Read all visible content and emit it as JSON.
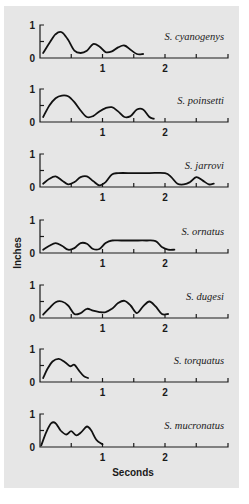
{
  "chart_data": {
    "type": "line",
    "title": "",
    "xlabel": "Seconds",
    "ylabel": "Inches",
    "xlim": [
      0,
      3
    ],
    "ylim": [
      0,
      1
    ],
    "x_ticks": [
      0.5,
      1,
      1.5,
      2,
      2.5,
      3
    ],
    "x_tick_labels": [
      {
        "value": 1,
        "label": "1"
      },
      {
        "value": 2,
        "label": "2"
      }
    ],
    "y_tick_labels": [
      {
        "value": 0,
        "label": "0"
      },
      {
        "value": 1,
        "label": "1"
      }
    ],
    "y_minor_ticks": [
      0.5
    ],
    "grid": false,
    "layout": "7 stacked small-multiple panels sharing x axis",
    "series": [
      {
        "name": "S. cyanogenys",
        "x": [
          0.05,
          0.15,
          0.25,
          0.35,
          0.45,
          0.55,
          0.65,
          0.75,
          0.85,
          0.95,
          1.05,
          1.15,
          1.25,
          1.35,
          1.45,
          1.55,
          1.65
        ],
        "values": [
          0.15,
          0.45,
          0.72,
          0.78,
          0.55,
          0.22,
          0.15,
          0.22,
          0.42,
          0.35,
          0.18,
          0.2,
          0.32,
          0.38,
          0.25,
          0.12,
          0.12
        ]
      },
      {
        "name": "S. poinsetti",
        "x": [
          0.05,
          0.15,
          0.25,
          0.35,
          0.45,
          0.55,
          0.65,
          0.75,
          0.85,
          0.95,
          1.05,
          1.15,
          1.25,
          1.35,
          1.45,
          1.55,
          1.65,
          1.75,
          1.82
        ],
        "values": [
          0.15,
          0.5,
          0.72,
          0.8,
          0.78,
          0.6,
          0.35,
          0.15,
          0.18,
          0.32,
          0.42,
          0.45,
          0.32,
          0.15,
          0.18,
          0.38,
          0.38,
          0.15,
          0.1
        ]
      },
      {
        "name": "S. jarrovi",
        "x": [
          0.05,
          0.15,
          0.25,
          0.35,
          0.45,
          0.55,
          0.65,
          0.75,
          0.85,
          0.95,
          1.05,
          1.15,
          1.25,
          1.5,
          1.75,
          2.0,
          2.1,
          2.2,
          2.3,
          2.4,
          2.5,
          2.6,
          2.7,
          2.78
        ],
        "values": [
          0.1,
          0.25,
          0.32,
          0.2,
          0.08,
          0.15,
          0.3,
          0.32,
          0.18,
          0.05,
          0.15,
          0.38,
          0.42,
          0.42,
          0.42,
          0.42,
          0.3,
          0.1,
          0.08,
          0.15,
          0.3,
          0.2,
          0.08,
          0.1
        ]
      },
      {
        "name": "S. ornatus",
        "x": [
          0.05,
          0.15,
          0.25,
          0.35,
          0.45,
          0.55,
          0.65,
          0.75,
          0.85,
          0.95,
          1.05,
          1.15,
          1.3,
          1.5,
          1.7,
          1.85,
          1.95,
          2.05,
          2.15
        ],
        "values": [
          0.1,
          0.22,
          0.3,
          0.22,
          0.1,
          0.15,
          0.3,
          0.28,
          0.12,
          0.12,
          0.3,
          0.38,
          0.38,
          0.38,
          0.38,
          0.36,
          0.18,
          0.1,
          0.1
        ]
      },
      {
        "name": "S. dugesi",
        "x": [
          0.05,
          0.15,
          0.25,
          0.35,
          0.45,
          0.55,
          0.65,
          0.75,
          0.85,
          0.95,
          1.05,
          1.15,
          1.25,
          1.35,
          1.45,
          1.55,
          1.65,
          1.75,
          1.85,
          1.95,
          2.05
        ],
        "values": [
          0.1,
          0.3,
          0.48,
          0.5,
          0.38,
          0.12,
          0.15,
          0.28,
          0.22,
          0.18,
          0.18,
          0.28,
          0.45,
          0.52,
          0.38,
          0.15,
          0.35,
          0.5,
          0.35,
          0.12,
          0.12
        ]
      },
      {
        "name": "S. torquatus",
        "x": [
          0.05,
          0.12,
          0.2,
          0.3,
          0.4,
          0.48,
          0.55,
          0.62,
          0.7,
          0.77
        ],
        "values": [
          0.12,
          0.4,
          0.62,
          0.7,
          0.6,
          0.48,
          0.52,
          0.35,
          0.18,
          0.12
        ]
      },
      {
        "name": "S. mucronatus",
        "x": [
          0.02,
          0.1,
          0.18,
          0.25,
          0.33,
          0.42,
          0.5,
          0.58,
          0.66,
          0.75,
          0.82,
          0.9,
          1.0
        ],
        "values": [
          0.05,
          0.45,
          0.72,
          0.72,
          0.5,
          0.38,
          0.48,
          0.35,
          0.45,
          0.62,
          0.5,
          0.22,
          0.08
        ]
      }
    ]
  },
  "labels": {
    "y_axis_title": "Inches",
    "x_axis_title": "Seconds",
    "tick_0": "0",
    "tick_1": "1",
    "tick_2": "2"
  }
}
